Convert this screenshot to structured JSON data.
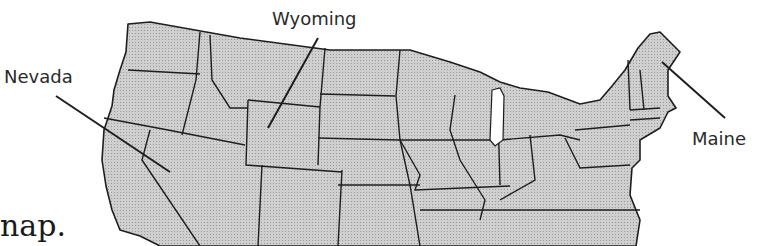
{
  "map": {
    "title_fragment": "nap.",
    "labels": {
      "nevada": "Nevada",
      "wyoming": "Wyoming",
      "maine": "Maine"
    },
    "colors": {
      "fill": "#c4c4c4",
      "stroke": "#1e1e1e",
      "lake": "#ffffff"
    }
  }
}
